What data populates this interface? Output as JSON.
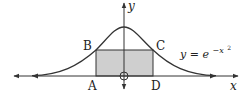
{
  "diagram": {
    "curve": {
      "equation_lhs": "y = e",
      "equation_exp": "−x",
      "equation_exp_power": "2",
      "stroke": "#333333"
    },
    "axes": {
      "x_label": "x",
      "y_label": "y",
      "origin_marker": "circle"
    },
    "rectangle": {
      "fill": "#cfcfcf",
      "stroke": "#333333",
      "vertices": {
        "A": "A",
        "B": "B",
        "C": "C",
        "D": "D"
      }
    }
  }
}
